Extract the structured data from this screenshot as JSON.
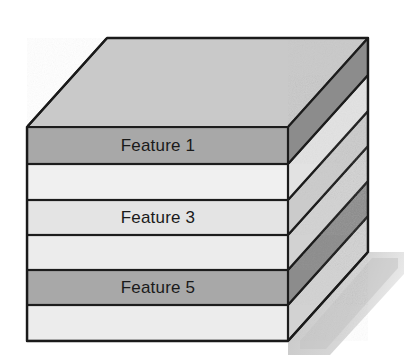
{
  "figure": {
    "background_color": "#ffffff",
    "outline_color": "#1a1a1a",
    "shadow_color": "#c6c6c6"
  },
  "geometry": {
    "front_left_x": 27,
    "front_right_x": 288,
    "front_top_y": 127,
    "front_bottom_y": 341,
    "depth_dx": 80,
    "depth_dy": -89,
    "top_face_color": "#c9c9c9"
  },
  "layers": [
    {
      "index": 1,
      "label": "Feature 1",
      "has_label": true,
      "front_color": "#a8a8a8",
      "side_color": "#8c8c8c",
      "front_top_y": 127,
      "front_bottom_y": 164,
      "label_x": 158,
      "label_y": 146
    },
    {
      "index": 2,
      "label": "",
      "has_label": false,
      "front_color": "#ececec",
      "side_color": "#d2d2d2",
      "front_top_y": 164,
      "front_bottom_y": 200,
      "label_x": 158,
      "label_y": 182
    },
    {
      "index": 3,
      "label": "Feature 3",
      "has_label": true,
      "front_color": "#e4e4e4",
      "side_color": "#cbcbcb",
      "front_top_y": 200,
      "front_bottom_y": 235,
      "label_x": 158,
      "label_y": 217
    },
    {
      "index": 4,
      "label": "",
      "has_label": false,
      "front_color": "#ececec",
      "side_color": "#d2d2d2",
      "front_top_y": 235,
      "front_bottom_y": 270,
      "label_x": 158,
      "label_y": 253
    },
    {
      "index": 5,
      "label": "Feature 5",
      "has_label": true,
      "front_color": "#a8a8a8",
      "side_color": "#8c8c8c",
      "front_top_y": 270,
      "front_bottom_y": 305,
      "label_x": 158,
      "label_y": 287
    },
    {
      "index": 6,
      "label": "",
      "has_label": false,
      "front_color": "#ececec",
      "side_color": "#d2d2d2",
      "front_top_y": 305,
      "front_bottom_y": 341,
      "label_x": 158,
      "label_y": 323
    }
  ]
}
